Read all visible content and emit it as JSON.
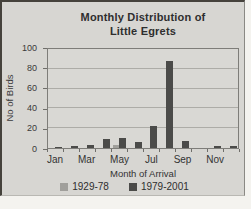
{
  "chart": {
    "frame": "scanned-figure"
  },
  "chart_data": {
    "type": "bar",
    "title": "Monthly Distribution of Little Egrets",
    "title_lines": [
      "Monthly Distribution of",
      "Little Egrets"
    ],
    "categories": [
      "Jan",
      "Feb",
      "Mar",
      "Apr",
      "May",
      "Jun",
      "Jul",
      "Aug",
      "Sep",
      "Oct",
      "Nov",
      "Dec"
    ],
    "x_label_indices": [
      0,
      2,
      4,
      6,
      8,
      10
    ],
    "x_tick_labels_shown": [
      "Jan",
      "Mar",
      "May",
      "Jul",
      "Sep",
      "Nov"
    ],
    "series": [
      {
        "name": "1929-78",
        "color": "#a09f9b",
        "values": [
          0,
          0,
          0,
          0,
          3,
          0,
          0,
          0,
          0,
          0,
          0,
          0
        ]
      },
      {
        "name": "1979-2001",
        "color": "#4b4b49",
        "values": [
          1,
          2,
          3,
          9,
          10,
          6,
          22,
          88,
          7,
          0,
          2,
          2
        ]
      }
    ],
    "xlabel": "Month of Arrival",
    "ylabel": "No of Birds",
    "ylim": [
      0,
      100
    ],
    "y_ticks": [
      0,
      20,
      40,
      60,
      80,
      100
    ],
    "grid": true,
    "legend_position": "bottom",
    "colors": {
      "plot_background": "#d9d8d4",
      "scan_background": "#d7d6d2",
      "gridline": "#adaca7",
      "axis_border": "#7e7d79",
      "text": "#333333"
    }
  }
}
